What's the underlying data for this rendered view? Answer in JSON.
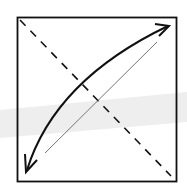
{
  "diagram": {
    "type": "origami-fold-step",
    "colors": {
      "background": "#ffffff",
      "stroke": "#111111",
      "thin_line": "#555555",
      "band": "#efefef"
    },
    "square": {
      "x": 17,
      "y": 17,
      "width": 159,
      "height": 164
    },
    "dashed_diagonal": {
      "x1": 19,
      "y1": 19,
      "x2": 171,
      "y2": 176
    },
    "thin_diagonal": {
      "x1": 45,
      "y1": 153,
      "x2": 157,
      "y2": 42
    },
    "arrow": {
      "start": [
        27,
        168
      ],
      "control": [
        60,
        70
      ],
      "end": [
        168,
        26
      ],
      "heads": "both"
    }
  }
}
